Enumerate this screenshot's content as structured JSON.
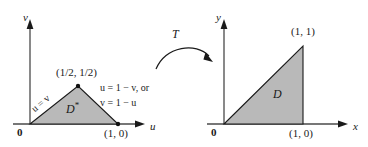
{
  "figure": {
    "fill_color": "#b9b9b9",
    "stroke_color": "#1a1a1a"
  },
  "left_plot": {
    "vertical_axis_label": "v",
    "horizontal_axis_label": "u",
    "origin_label": "0",
    "region_label": "D",
    "region_superscript": "*",
    "apex_point_label": "(1/2, 1/2)",
    "right_point_label": "(1, 0)",
    "edge_label_left": "u = v",
    "edge_label_right_line1": "u = 1 − v, or",
    "edge_label_right_line2": "v = 1 − u"
  },
  "transform": {
    "label": "T"
  },
  "right_plot": {
    "vertical_axis_label": "y",
    "horizontal_axis_label": "x",
    "origin_label": "0",
    "region_label": "D",
    "top_point_label": "(1, 1)",
    "bottom_point_label": "(1, 0)"
  }
}
